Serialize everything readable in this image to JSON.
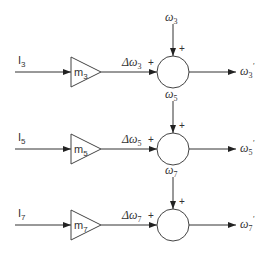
{
  "diagram": {
    "type": "block-diagram",
    "stages": [
      {
        "input": {
          "base": "I",
          "sub": "3"
        },
        "gain": {
          "base": "m",
          "sub": "3"
        },
        "gain_output": {
          "base": "Δω",
          "sub": "3"
        },
        "external_input": {
          "base": "ω",
          "sub": "3"
        },
        "output": {
          "base": "ω",
          "sub": "3",
          "sup": "'"
        },
        "signs": {
          "left": "+",
          "top": "+"
        }
      },
      {
        "input": {
          "base": "I",
          "sub": "5"
        },
        "gain": {
          "base": "m",
          "sub": "5"
        },
        "gain_output": {
          "base": "Δω",
          "sub": "5"
        },
        "external_input": {
          "base": "ω",
          "sub": "5"
        },
        "output": {
          "base": "ω",
          "sub": "5",
          "sup": "'"
        },
        "signs": {
          "left": "+",
          "top": "+"
        }
      },
      {
        "input": {
          "base": "I",
          "sub": "7"
        },
        "gain": {
          "base": "m",
          "sub": "7"
        },
        "gain_output": {
          "base": "Δω",
          "sub": "7"
        },
        "external_input": {
          "base": "ω",
          "sub": "7"
        },
        "output": {
          "base": "ω",
          "sub": "7",
          "sup": "'"
        },
        "signs": {
          "left": "+",
          "top": "+"
        }
      }
    ],
    "colors": {
      "stroke": "#333333",
      "background": "#ffffff"
    }
  }
}
